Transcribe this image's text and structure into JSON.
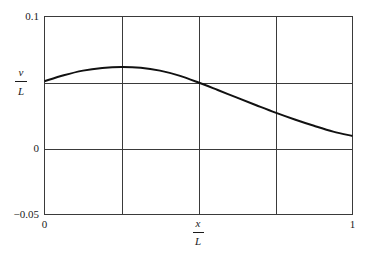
{
  "chart_data": {
    "type": "line",
    "title": "",
    "xlabel": "x/L",
    "ylabel": "v/L",
    "xlabel_num": "x",
    "xlabel_den": "L",
    "ylabel_num": "v",
    "ylabel_den": "L",
    "xlim": [
      0,
      1
    ],
    "ylim": [
      -0.05,
      0.1
    ],
    "x_ticks": [
      0,
      0.5,
      1
    ],
    "x_tick_labels": [
      "0",
      "",
      "1"
    ],
    "y_ticks": [
      -0.05,
      0,
      0.1
    ],
    "y_tick_labels": [
      "−0.05",
      "0",
      "0.1"
    ],
    "grid": {
      "x": [
        0.25,
        0.5,
        0.75
      ],
      "y": [
        0,
        0.05
      ]
    },
    "legend": null,
    "series": [
      {
        "name": "v/L",
        "x": [
          0,
          0.0625,
          0.125,
          0.1875,
          0.25,
          0.3125,
          0.375,
          0.4375,
          0.5,
          0.5625,
          0.625,
          0.6875,
          0.75,
          0.8125,
          0.875,
          0.9375,
          1.0
        ],
        "y": [
          0.051,
          0.0555,
          0.059,
          0.061,
          0.0618,
          0.0612,
          0.059,
          0.0552,
          0.05,
          0.0443,
          0.0385,
          0.0328,
          0.0272,
          0.022,
          0.0172,
          0.0128,
          0.0095
        ]
      }
    ]
  }
}
